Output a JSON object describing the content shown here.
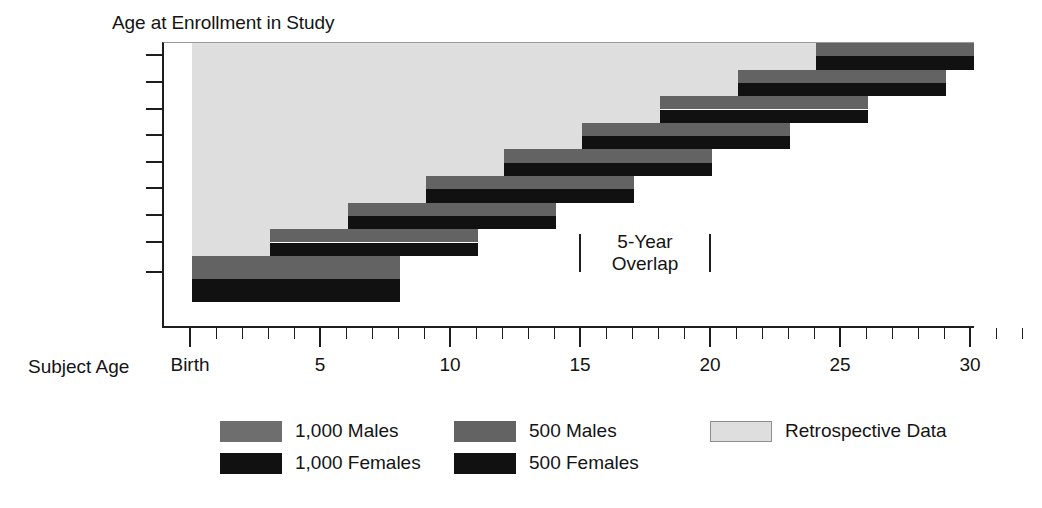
{
  "chart_data": {
    "type": "bar",
    "title": "",
    "ylabel": "Age at Enrollment in Study",
    "xlabel": "Subject Age",
    "xlim": [
      0,
      32
    ],
    "ylim_categories": [
      "Prenatal",
      "3",
      "6",
      "9",
      "12",
      "15",
      "18",
      "21",
      "24"
    ],
    "grid": false,
    "legend_position": "bottom",
    "x_ticks_major": [
      {
        "value": 0,
        "label": "Birth"
      },
      {
        "value": 5,
        "label": "5"
      },
      {
        "value": 10,
        "label": "10"
      },
      {
        "value": 15,
        "label": "15"
      },
      {
        "value": 20,
        "label": "20"
      },
      {
        "value": 25,
        "label": "25"
      },
      {
        "value": 30,
        "label": "30"
      }
    ],
    "x_ticks_minor": [
      1,
      2,
      3,
      4,
      6,
      7,
      8,
      9,
      11,
      12,
      13,
      14,
      16,
      17,
      18,
      19,
      21,
      22,
      23,
      24,
      26,
      27,
      28,
      29,
      31,
      32
    ],
    "y_ticks": [
      "24",
      "21",
      "18",
      "15",
      "12",
      "9",
      "6",
      "3",
      "Prenatal"
    ],
    "cohorts": [
      {
        "enrollment": "24",
        "retrospective_start": 0,
        "retrospective_end": 24,
        "prospective_start": 24,
        "prospective_end": 32
      },
      {
        "enrollment": "21",
        "retrospective_start": 0,
        "retrospective_end": 21,
        "prospective_start": 21,
        "prospective_end": 29
      },
      {
        "enrollment": "18",
        "retrospective_start": 0,
        "retrospective_end": 18,
        "prospective_start": 18,
        "prospective_end": 26
      },
      {
        "enrollment": "15",
        "retrospective_start": 0,
        "retrospective_end": 15,
        "prospective_start": 15,
        "prospective_end": 23
      },
      {
        "enrollment": "12",
        "retrospective_start": 0,
        "retrospective_end": 12,
        "prospective_start": 12,
        "prospective_end": 20
      },
      {
        "enrollment": "9",
        "retrospective_start": 0,
        "retrospective_end": 9,
        "prospective_start": 9,
        "prospective_end": 17
      },
      {
        "enrollment": "6",
        "retrospective_start": 0,
        "retrospective_end": 6,
        "prospective_start": 6,
        "prospective_end": 14
      },
      {
        "enrollment": "3",
        "retrospective_start": 0,
        "retrospective_end": 3,
        "prospective_start": 3,
        "prospective_end": 11
      },
      {
        "enrollment": "Prenatal",
        "retrospective_start": 0,
        "retrospective_end": 0,
        "prospective_start": 0,
        "prospective_end": 8
      }
    ],
    "annotation": {
      "text_line1": "5-Year",
      "text_line2": "Overlap",
      "span_start": 15,
      "span_end": 20
    },
    "legend": [
      {
        "key": "males_1000",
        "label": "1,000 Males",
        "color": "#6e6e6e"
      },
      {
        "key": "females_1000",
        "label": "1,000 Females",
        "color": "#111111"
      },
      {
        "key": "males_500",
        "label": "500 Males",
        "color": "#636363"
      },
      {
        "key": "females_500",
        "label": "500 Females",
        "color": "#111111"
      },
      {
        "key": "retrospective",
        "label": "Retrospective Data",
        "color": "#dedede"
      }
    ]
  },
  "axes": {
    "y_title": "Age at Enrollment in Study",
    "x_title": "Subject Age"
  },
  "annotation": {
    "line1": "5-Year",
    "line2": "Overlap"
  },
  "legend": {
    "items": [
      {
        "label": "1,000 Males"
      },
      {
        "label": "1,000 Females"
      },
      {
        "label": "500 Males"
      },
      {
        "label": "500 Females"
      },
      {
        "label": "Retrospective Data"
      }
    ]
  }
}
